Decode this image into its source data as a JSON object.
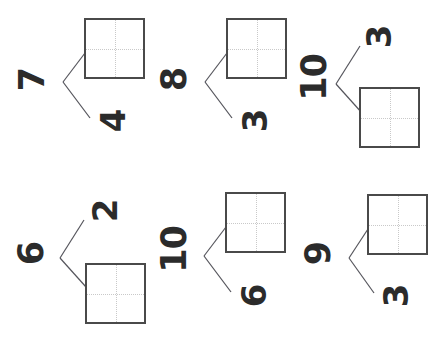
{
  "page": {
    "orientation": "numerals rotated 90 degrees counter-clockwise",
    "background_color": "#ffffff",
    "ink_color": "#2b2b2b",
    "box_border_color": "#4a4a4a",
    "connector_color": "#55555c",
    "guide_color": "#c9c9c9",
    "problem_count": 6
  },
  "problems": [
    {
      "id": "problem-1",
      "whole": "7",
      "part_top": "",
      "part_top_is_box": true,
      "part_bottom": "4",
      "part_bottom_is_box": false
    },
    {
      "id": "problem-2",
      "whole": "8",
      "part_top": "",
      "part_top_is_box": true,
      "part_bottom": "3",
      "part_bottom_is_box": false
    },
    {
      "id": "problem-3",
      "whole": "10",
      "part_top": "3",
      "part_top_is_box": false,
      "part_bottom": "",
      "part_bottom_is_box": true
    },
    {
      "id": "problem-4",
      "whole": "6",
      "part_top": "2",
      "part_top_is_box": false,
      "part_bottom": "",
      "part_bottom_is_box": true
    },
    {
      "id": "problem-5",
      "whole": "10",
      "part_top": "",
      "part_top_is_box": true,
      "part_bottom": "6",
      "part_bottom_is_box": false
    },
    {
      "id": "problem-6",
      "whole": "9",
      "part_top": "",
      "part_top_is_box": true,
      "part_bottom": "3",
      "part_bottom_is_box": false
    }
  ]
}
